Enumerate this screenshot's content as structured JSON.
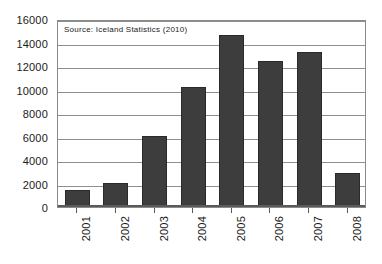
{
  "chart_data": {
    "type": "bar",
    "title": "",
    "subtitle": "",
    "xlabel": "",
    "ylabel": "",
    "categories": [
      "2001",
      "2002",
      "2003",
      "2004",
      "2005",
      "2006",
      "2007",
      "2008"
    ],
    "values": [
      1450,
      2050,
      6050,
      10250,
      14600,
      12400,
      13200,
      2900
    ],
    "series": [
      {
        "name": "",
        "values": [
          1450,
          2050,
          6050,
          10250,
          14600,
          12400,
          13200,
          2900
        ]
      }
    ],
    "ylim": [
      0,
      16000
    ],
    "y_ticks": [
      0,
      2000,
      4000,
      6000,
      8000,
      10000,
      12000,
      14000,
      16000
    ],
    "y_tick_labels": [
      "0",
      "2000",
      "4000",
      "6000",
      "8000",
      "10000",
      "12000",
      "14000",
      "16000"
    ],
    "grid": true,
    "legend": false,
    "legend_position": "none",
    "annotations": [
      {
        "name": "source-note",
        "text": "Source: Iceland Statistics (2010)"
      }
    ],
    "colors": {
      "bar_fill": "#3d3d3d",
      "bar_border": "#2a2a2a",
      "gridline": "#8f8f8f",
      "axis": "#5a5a5a",
      "plot_border": "#8a8a8a",
      "background": "#ffffff",
      "text": "#1a1a1a"
    }
  }
}
